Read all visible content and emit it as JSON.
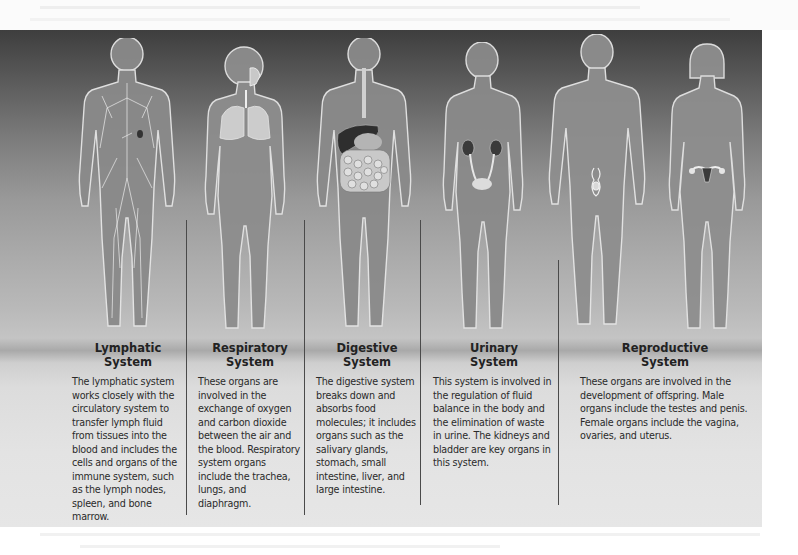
{
  "figure": {
    "background_colors": {
      "top": "#3e3e3e",
      "middle": "#b9b9b9",
      "floor_shadow": "#a9a9a9",
      "bottom": "#e6e6e6"
    },
    "divider_color": "#4a4a4a",
    "bodies": [
      {
        "id": "lymphatic",
        "sex": "male",
        "highlight": "lymph vessels and nodes"
      },
      {
        "id": "respiratory",
        "sex": "female",
        "highlight": "trachea and lungs"
      },
      {
        "id": "digestive",
        "sex": "male",
        "highlight": "esophagus, liver, stomach, intestines"
      },
      {
        "id": "urinary",
        "sex": "female",
        "highlight": "kidneys, ureters, bladder"
      },
      {
        "id": "reproductive-male",
        "sex": "male",
        "highlight": "testes and penis"
      },
      {
        "id": "reproductive-female",
        "sex": "female",
        "highlight": "ovaries and uterus"
      }
    ],
    "systems": [
      {
        "title_line1": "Lymphatic",
        "title_line2": "System",
        "description": "The lymphatic system works closely with the circulatory system to transfer lymph fluid from tissues into the blood and includes the cells and organs of the immune system, such as the lymph nodes, spleen, and bone marrow."
      },
      {
        "title_line1": "Respiratory",
        "title_line2": "System",
        "description": "These organs are involved in the exchange of oxygen and carbon dioxide between the air and the blood. Respiratory system organs include the trachea, lungs, and diaphragm."
      },
      {
        "title_line1": "Digestive",
        "title_line2": "System",
        "description": "The digestive system breaks down and absorbs food molecules; it includes organs such as the salivary glands, stomach, small intestine, liver, and large intestine."
      },
      {
        "title_line1": "Urinary",
        "title_line2": "System",
        "description": "This system is involved in the regulation of fluid balance in the body and the elimination of waste in urine. The kidneys and bladder are key organs in this system."
      },
      {
        "title_line1": "Reproductive",
        "title_line2": "System",
        "description": "These organs are involved in the development of offspring. Male organs include the testes and penis. Female organs include the vagina, ovaries, and uterus."
      }
    ]
  }
}
